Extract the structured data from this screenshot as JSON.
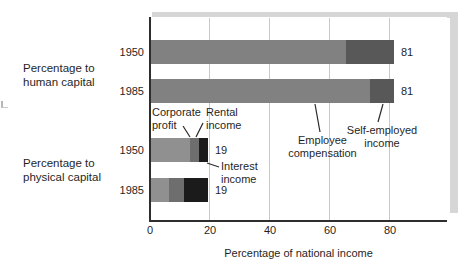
{
  "figure": {
    "xlabel": "Percentage of national income",
    "group_labels": {
      "human": "Percentage to\nhuman capital",
      "physical": "Percentage to\nphysical capital"
    },
    "annotations": {
      "corporate_profit": "Corporate\nprofit",
      "rental_income": "Rental\nincome",
      "interest_income": "Interest\nincome",
      "employee_compensation": "Employee\ncompensation",
      "self_employed_income": "Self-employed\nincome"
    }
  },
  "chart_data": {
    "type": "bar",
    "orientation": "horizontal-stacked",
    "title": "",
    "xlabel": "Percentage of national income",
    "ylabel": "",
    "x_ticks": [
      0,
      20,
      40,
      60,
      80
    ],
    "xlim": [
      0,
      99
    ],
    "grid": "vertical-light",
    "legend": "none (segments labeled by leader-line annotations)",
    "groups": [
      {
        "label": "Percentage to human capital",
        "rows": [
          {
            "year": "1950",
            "total_label": "81",
            "segments": [
              {
                "name": "Employee compensation",
                "value": 65,
                "color": "#818181"
              },
              {
                "name": "Self-employed income",
                "value": 16,
                "color": "#585858"
              }
            ]
          },
          {
            "year": "1985",
            "total_label": "81",
            "segments": [
              {
                "name": "Employee compensation",
                "value": 73,
                "color": "#818181"
              },
              {
                "name": "Self-employed income",
                "value": 8,
                "color": "#585858"
              }
            ]
          }
        ]
      },
      {
        "label": "Percentage to physical capital",
        "rows": [
          {
            "year": "1950",
            "total_label": "19",
            "segments": [
              {
                "name": "Corporate profit",
                "value": 13,
                "color": "#909090"
              },
              {
                "name": "Rental income",
                "value": 3,
                "color": "#6e6e6e"
              },
              {
                "name": "Interest income",
                "value": 3,
                "color": "#1b1b1b"
              }
            ]
          },
          {
            "year": "1985",
            "total_label": "19",
            "segments": [
              {
                "name": "Corporate profit",
                "value": 6,
                "color": "#909090"
              },
              {
                "name": "Rental income",
                "value": 5,
                "color": "#6e6e6e"
              },
              {
                "name": "Interest income",
                "value": 8,
                "color": "#1b1b1b"
              }
            ]
          }
        ]
      }
    ]
  }
}
